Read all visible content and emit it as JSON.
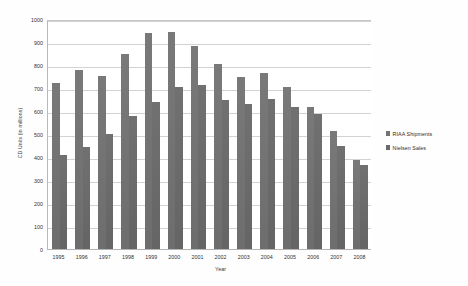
{
  "chart_data": {
    "type": "bar",
    "title": "",
    "subtitle": "",
    "xlabel": "Year",
    "ylabel": "CD Units (in millions)",
    "ylim": [
      0,
      1000
    ],
    "ytick_step": 100,
    "yticks": [
      "1000",
      "900",
      "800",
      "700",
      "600",
      "500",
      "400",
      "300",
      "200",
      "100",
      "0"
    ],
    "grid": true,
    "legend_position": "right",
    "categories": [
      "1995",
      "1996",
      "1997",
      "1998",
      "1999",
      "2000",
      "2001",
      "2002",
      "2003",
      "2004",
      "2005",
      "2006",
      "2007",
      "2008"
    ],
    "series": [
      {
        "name": "RIAA Shipments",
        "color": "#737373",
        "values": [
          723,
          779,
          753,
          847,
          938,
          942,
          881,
          803,
          746,
          767,
          705,
          619,
          511,
          385
        ]
      },
      {
        "name": "Nielsen Sales",
        "color": "#6a6a6a",
        "values": [
          407,
          444,
          498,
          578,
          639,
          705,
          712,
          649,
          632,
          651,
          618,
          588,
          450,
          365
        ]
      }
    ]
  }
}
